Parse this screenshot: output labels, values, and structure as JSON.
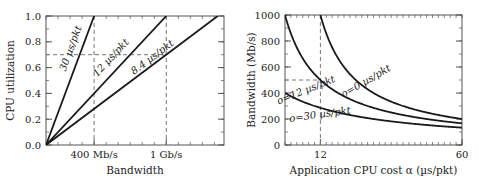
{
  "chart_data": [
    {
      "type": "line",
      "title": "",
      "xlabel": "Bandwidth",
      "ylabel": "CPU utilization",
      "xlim": [
        0,
        1480
      ],
      "ylim": [
        0,
        1.0
      ],
      "x_unit": "Mb/s",
      "xticks": [
        {
          "value": 400,
          "label": "400 Mb/s"
        },
        {
          "value": 1000,
          "label": "1 Gb/s"
        }
      ],
      "x_minor_step": 100,
      "yticks": [
        {
          "value": 0.0,
          "label": "0.0"
        },
        {
          "value": 0.2,
          "label": "0.2"
        },
        {
          "value": 0.4,
          "label": "0.4"
        },
        {
          "value": 0.6,
          "label": "0.6"
        },
        {
          "value": 0.8,
          "label": "0.8"
        },
        {
          "value": 1.0,
          "label": "1.0"
        }
      ],
      "y_minor_step": 0.1,
      "grid": false,
      "series": [
        {
          "name": "30 µs/pkt",
          "x": [
            0,
            400
          ],
          "values": [
            0,
            1.0
          ]
        },
        {
          "name": "12 µs/pkt",
          "x": [
            0,
            1000
          ],
          "values": [
            0,
            1.0
          ]
        },
        {
          "name": "8.4 µs/pkt",
          "x": [
            0,
            1428
          ],
          "values": [
            0,
            1.0
          ]
        }
      ],
      "annotations": {
        "dashed_vertical": [
          400,
          1000
        ],
        "dashed_horizontal": [
          {
            "y": 0.7,
            "x_to": 1000
          }
        ],
        "series_labels": [
          {
            "text": "30 µs/pkt",
            "x": 230,
            "y": 0.74,
            "angle": -70
          },
          {
            "text": "12 µs/pkt",
            "x": 560,
            "y": 0.66,
            "angle": -47
          },
          {
            "text": "8.4 µs/pkt",
            "x": 900,
            "y": 0.66,
            "angle": -37
          }
        ]
      }
    },
    {
      "type": "line",
      "title": "",
      "xlabel": "Application CPU cost α (µs/pkt)",
      "ylabel": "Bandwidth (Mb/s)",
      "xlim": [
        0,
        60
      ],
      "ylim": [
        0,
        1000
      ],
      "xticks": [
        {
          "value": 12,
          "label": "12"
        },
        {
          "value": 60,
          "label": "60"
        }
      ],
      "x_minor_step": 2,
      "yticks": [
        {
          "value": 0,
          "label": "0"
        },
        {
          "value": 200,
          "label": "200"
        },
        {
          "value": 400,
          "label": "400"
        },
        {
          "value": 600,
          "label": "600"
        },
        {
          "value": 800,
          "label": "800"
        },
        {
          "value": 1000,
          "label": "1000"
        }
      ],
      "y_minor_step": 100,
      "grid": false,
      "formula": "B = 12000 / (alpha + o)",
      "series": [
        {
          "name": "o=0 µs/pkt",
          "o": 0,
          "x": [
            12,
            15,
            20,
            25,
            30,
            40,
            50,
            60
          ],
          "values": [
            1000,
            800,
            600,
            480,
            400,
            300,
            240,
            200
          ]
        },
        {
          "name": "o=12 µs/pkt",
          "o": 12,
          "x": [
            0,
            6,
            12,
            20,
            30,
            40,
            50,
            60
          ],
          "values": [
            1000,
            667,
            500,
            375,
            286,
            231,
            194,
            167
          ]
        },
        {
          "name": "o=30 µs/pkt",
          "o": 30,
          "x": [
            0,
            6,
            12,
            20,
            30,
            40,
            50,
            60
          ],
          "values": [
            400,
            333,
            286,
            240,
            200,
            171,
            150,
            133
          ]
        }
      ],
      "annotations": {
        "dashed_vertical": [
          12
        ],
        "dashed_horizontal": [
          {
            "y": 500,
            "x_to": 12
          }
        ],
        "series_labels": [
          {
            "text": "o=0 µs/pkt",
            "x": 28,
            "y": 470,
            "angle": -30
          },
          {
            "text": "o=12 µs/pkt",
            "x": 7.5,
            "y": 400,
            "angle": -22
          },
          {
            "text": "o=30 µs/pkt",
            "x": 12,
            "y": 210,
            "angle": -8
          }
        ]
      }
    }
  ],
  "layout": {
    "frames": [
      {
        "left": 46,
        "top": 16,
        "right": 224,
        "bottom": 145
      },
      {
        "left": 285,
        "top": 15,
        "right": 462,
        "bottom": 145
      }
    ],
    "colors": {
      "line": "#1a1a1a",
      "frame": "#555555",
      "dashed": "#777777",
      "text": "#222222"
    }
  }
}
